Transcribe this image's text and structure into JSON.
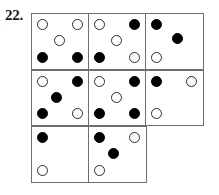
{
  "figure": {
    "question_number": "22.",
    "type": "dot-matrix-puzzle",
    "colors": {
      "grid_line": "#6e6e6e",
      "dot_open_stroke": "#2b2b2b",
      "dot_filled": "#000000",
      "background": "#ffffff",
      "text": "#1a1a1a"
    },
    "grid": {
      "columns": 3,
      "rows": 3,
      "dot_slots": [
        "top-left",
        "top-right",
        "center",
        "bottom-left",
        "bottom-right"
      ],
      "cells": [
        [
          {
            "present": true,
            "name": "cell-r1c1",
            "dots": {
              "top-left": "open",
              "top-right": "open",
              "center": "open",
              "bottom-left": "filled",
              "bottom-right": "filled"
            }
          },
          {
            "present": true,
            "name": "cell-r1c2",
            "dots": {
              "top-left": "open",
              "top-right": "filled",
              "center": "open",
              "bottom-left": "filled",
              "bottom-right": "open"
            }
          },
          {
            "present": true,
            "name": "cell-r1c3",
            "dots": {
              "top-left": "filled",
              "top-right": "none",
              "center": "filled",
              "bottom-left": "open",
              "bottom-right": "none"
            }
          }
        ],
        [
          {
            "present": true,
            "name": "cell-r2c1",
            "dots": {
              "top-left": "open",
              "top-right": "filled",
              "center": "filled",
              "bottom-left": "filled",
              "bottom-right": "open"
            }
          },
          {
            "present": true,
            "name": "cell-r2c2",
            "dots": {
              "top-left": "open",
              "top-right": "filled",
              "center": "open",
              "bottom-left": "filled",
              "bottom-right": "filled"
            }
          },
          {
            "present": true,
            "name": "cell-r2c3",
            "dots": {
              "top-left": "filled",
              "top-right": "open",
              "center": "none",
              "bottom-left": "open",
              "bottom-right": "none"
            }
          }
        ],
        [
          {
            "present": true,
            "name": "cell-r3c1",
            "dots": {
              "top-left": "filled",
              "top-right": "none",
              "center": "none",
              "bottom-left": "open",
              "bottom-right": "none"
            }
          },
          {
            "present": true,
            "name": "cell-r3c2",
            "dots": {
              "top-left": "filled",
              "top-right": "open",
              "center": "filled",
              "bottom-left": "open",
              "bottom-right": "none"
            }
          },
          {
            "present": false,
            "name": "cell-r3c3-missing",
            "dots": {}
          }
        ]
      ]
    }
  }
}
